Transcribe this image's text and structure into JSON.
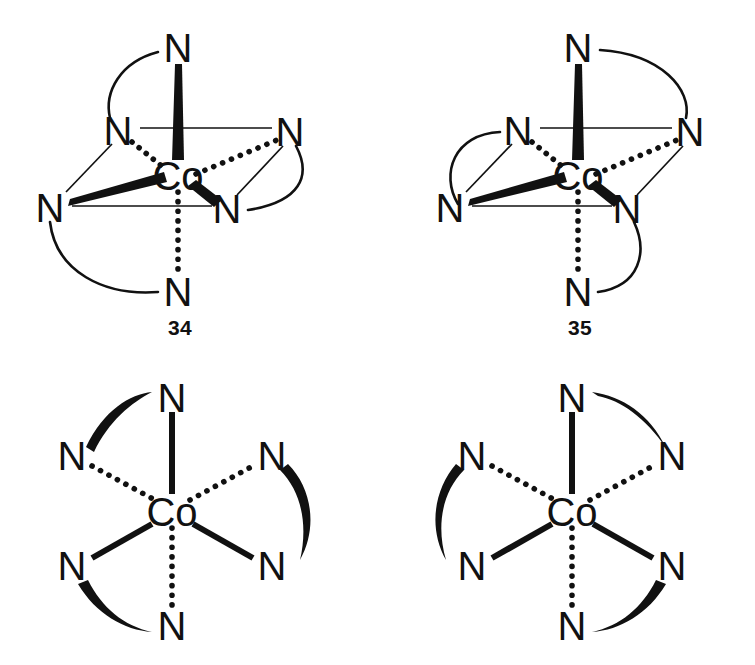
{
  "figure": {
    "kind": "chemical-structure-diagram",
    "background": "#ffffff",
    "ink": "#111111",
    "metal_symbol": "Co",
    "ligand_symbol": "N"
  },
  "structures": [
    {
      "id": "34",
      "number_label": "34",
      "projection": "octahedral-perspective",
      "center": {
        "symbol": "Co",
        "x": 178,
        "y": 176
      },
      "donors": [
        {
          "key": "top",
          "symbol": "N",
          "x": 178,
          "y": 48,
          "bond": "wedge"
        },
        {
          "key": "upper-left",
          "symbol": "N",
          "x": 118,
          "y": 131,
          "bond": "dotted"
        },
        {
          "key": "upper-right",
          "symbol": "N",
          "x": 290,
          "y": 132,
          "bond": "dotted"
        },
        {
          "key": "left",
          "symbol": "N",
          "x": 50,
          "y": 208,
          "bond": "wedge"
        },
        {
          "key": "lower-right",
          "symbol": "N",
          "x": 227,
          "y": 209,
          "bond": "wedge"
        },
        {
          "key": "bottom",
          "symbol": "N",
          "x": 178,
          "y": 292,
          "bond": "dotted"
        }
      ],
      "chelate_arcs": [
        {
          "from": "top",
          "to": "upper-left",
          "sweep": "left"
        },
        {
          "from": "upper-right",
          "to": "lower-right",
          "sweep": "right"
        },
        {
          "from": "left",
          "to": "bottom",
          "sweep": "left"
        }
      ]
    },
    {
      "id": "35",
      "number_label": "35",
      "projection": "octahedral-perspective",
      "center": {
        "symbol": "Co",
        "x": 578,
        "y": 176
      },
      "donors": [
        {
          "key": "top",
          "symbol": "N",
          "x": 578,
          "y": 48,
          "bond": "wedge"
        },
        {
          "key": "upper-left",
          "symbol": "N",
          "x": 518,
          "y": 131,
          "bond": "dotted"
        },
        {
          "key": "upper-right",
          "symbol": "N",
          "x": 690,
          "y": 132,
          "bond": "dotted"
        },
        {
          "key": "left",
          "symbol": "N",
          "x": 450,
          "y": 208,
          "bond": "wedge"
        },
        {
          "key": "lower-right",
          "symbol": "N",
          "x": 627,
          "y": 209,
          "bond": "wedge"
        },
        {
          "key": "bottom",
          "symbol": "N",
          "x": 578,
          "y": 292,
          "bond": "dotted"
        }
      ],
      "chelate_arcs": [
        {
          "from": "top",
          "to": "upper-right",
          "sweep": "right"
        },
        {
          "from": "upper-left",
          "to": "left",
          "sweep": "left"
        },
        {
          "from": "bottom",
          "to": "lower-right",
          "sweep": "right"
        }
      ]
    },
    {
      "id": "bottom-left",
      "number_label": "",
      "projection": "trigonal-radial",
      "center": {
        "symbol": "Co",
        "x": 172,
        "y": 512
      },
      "donors": [
        {
          "key": "top",
          "symbol": "N",
          "x": 172,
          "y": 398,
          "bond": "solid"
        },
        {
          "key": "upper-left",
          "symbol": "N",
          "x": 72,
          "y": 456,
          "bond": "dotted"
        },
        {
          "key": "upper-right",
          "symbol": "N",
          "x": 272,
          "y": 456,
          "bond": "dotted"
        },
        {
          "key": "lower-left",
          "symbol": "N",
          "x": 72,
          "y": 566,
          "bond": "solid"
        },
        {
          "key": "lower-right",
          "symbol": "N",
          "x": 272,
          "y": 566,
          "bond": "solid"
        },
        {
          "key": "bottom",
          "symbol": "N",
          "x": 172,
          "y": 626,
          "bond": "dotted"
        }
      ],
      "chelate_arcs": [
        {
          "from": "upper-left",
          "to": "top",
          "sweep": "over-top"
        },
        {
          "from": "upper-right",
          "to": "lower-right",
          "sweep": "over-right"
        },
        {
          "from": "lower-left",
          "to": "bottom",
          "sweep": "under-left"
        }
      ]
    },
    {
      "id": "bottom-right",
      "number_label": "",
      "projection": "trigonal-radial",
      "center": {
        "symbol": "Co",
        "x": 572,
        "y": 512
      },
      "donors": [
        {
          "key": "top",
          "symbol": "N",
          "x": 572,
          "y": 398,
          "bond": "solid"
        },
        {
          "key": "upper-left",
          "symbol": "N",
          "x": 472,
          "y": 456,
          "bond": "dotted"
        },
        {
          "key": "upper-right",
          "symbol": "N",
          "x": 672,
          "y": 456,
          "bond": "dotted"
        },
        {
          "key": "lower-left",
          "symbol": "N",
          "x": 472,
          "y": 566,
          "bond": "solid"
        },
        {
          "key": "lower-right",
          "symbol": "N",
          "x": 672,
          "y": 566,
          "bond": "solid"
        },
        {
          "key": "bottom",
          "symbol": "N",
          "x": 572,
          "y": 626,
          "bond": "dotted"
        }
      ],
      "chelate_arcs": [
        {
          "from": "top",
          "to": "upper-right",
          "sweep": "over-top-right"
        },
        {
          "from": "upper-left",
          "to": "lower-left",
          "sweep": "over-left"
        },
        {
          "from": "lower-right",
          "to": "bottom",
          "sweep": "under-right"
        }
      ]
    }
  ]
}
